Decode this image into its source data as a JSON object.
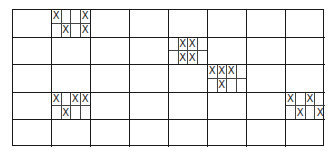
{
  "grid": {
    "rows": 5,
    "cols": 8,
    "mark": "X",
    "subdivided_cells": [
      {
        "row": 0,
        "col": 1,
        "marks": [
          [
            1,
            0,
            0,
            1
          ],
          [
            0,
            1,
            0,
            1
          ]
        ]
      },
      {
        "row": 1,
        "col": 4,
        "marks": [
          [
            0,
            1,
            1,
            0
          ],
          [
            0,
            1,
            1,
            0
          ]
        ]
      },
      {
        "row": 2,
        "col": 5,
        "marks": [
          [
            1,
            1,
            1,
            0
          ],
          [
            0,
            1,
            0,
            0
          ]
        ]
      },
      {
        "row": 3,
        "col": 1,
        "marks": [
          [
            1,
            0,
            1,
            1
          ],
          [
            0,
            1,
            0,
            0
          ]
        ]
      },
      {
        "row": 3,
        "col": 7,
        "marks": [
          [
            1,
            0,
            1,
            0
          ],
          [
            0,
            1,
            0,
            1
          ]
        ]
      }
    ]
  }
}
